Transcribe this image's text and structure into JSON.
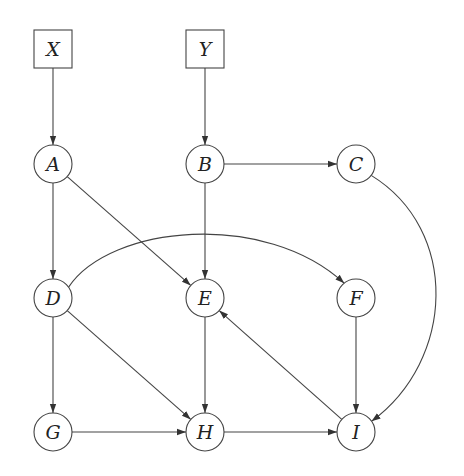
{
  "diagram": {
    "type": "directed-graph",
    "nodes": [
      {
        "id": "X",
        "label": "X",
        "shape": "box",
        "x": 53,
        "y": 49
      },
      {
        "id": "Y",
        "label": "Y",
        "shape": "box",
        "x": 205,
        "y": 49
      },
      {
        "id": "A",
        "label": "A",
        "shape": "circle",
        "x": 53,
        "y": 164
      },
      {
        "id": "B",
        "label": "B",
        "shape": "circle",
        "x": 205,
        "y": 164
      },
      {
        "id": "C",
        "label": "C",
        "shape": "circle",
        "x": 356,
        "y": 164
      },
      {
        "id": "D",
        "label": "D",
        "shape": "circle",
        "x": 53,
        "y": 298
      },
      {
        "id": "E",
        "label": "E",
        "shape": "circle",
        "x": 205,
        "y": 298
      },
      {
        "id": "F",
        "label": "F",
        "shape": "circle",
        "x": 356,
        "y": 298
      },
      {
        "id": "G",
        "label": "G",
        "shape": "circle",
        "x": 53,
        "y": 432
      },
      {
        "id": "H",
        "label": "H",
        "shape": "circle",
        "x": 205,
        "y": 432
      },
      {
        "id": "I",
        "label": "I",
        "shape": "circle",
        "x": 356,
        "y": 432
      }
    ],
    "edges": [
      {
        "from": "X",
        "to": "A",
        "curved": false
      },
      {
        "from": "Y",
        "to": "B",
        "curved": false
      },
      {
        "from": "A",
        "to": "D",
        "curved": false
      },
      {
        "from": "A",
        "to": "E",
        "curved": false
      },
      {
        "from": "B",
        "to": "C",
        "curved": false
      },
      {
        "from": "B",
        "to": "E",
        "curved": false
      },
      {
        "from": "C",
        "to": "I",
        "curved": true
      },
      {
        "from": "D",
        "to": "F",
        "curved": true
      },
      {
        "from": "D",
        "to": "G",
        "curved": false
      },
      {
        "from": "D",
        "to": "H",
        "curved": false
      },
      {
        "from": "E",
        "to": "H",
        "curved": false
      },
      {
        "from": "F",
        "to": "I",
        "curved": false
      },
      {
        "from": "I",
        "to": "E",
        "curved": false
      },
      {
        "from": "G",
        "to": "H",
        "curved": false
      },
      {
        "from": "H",
        "to": "I",
        "curved": false
      }
    ],
    "colors": {
      "stroke": "#444444",
      "text": "#222222",
      "background": "#ffffff"
    }
  }
}
